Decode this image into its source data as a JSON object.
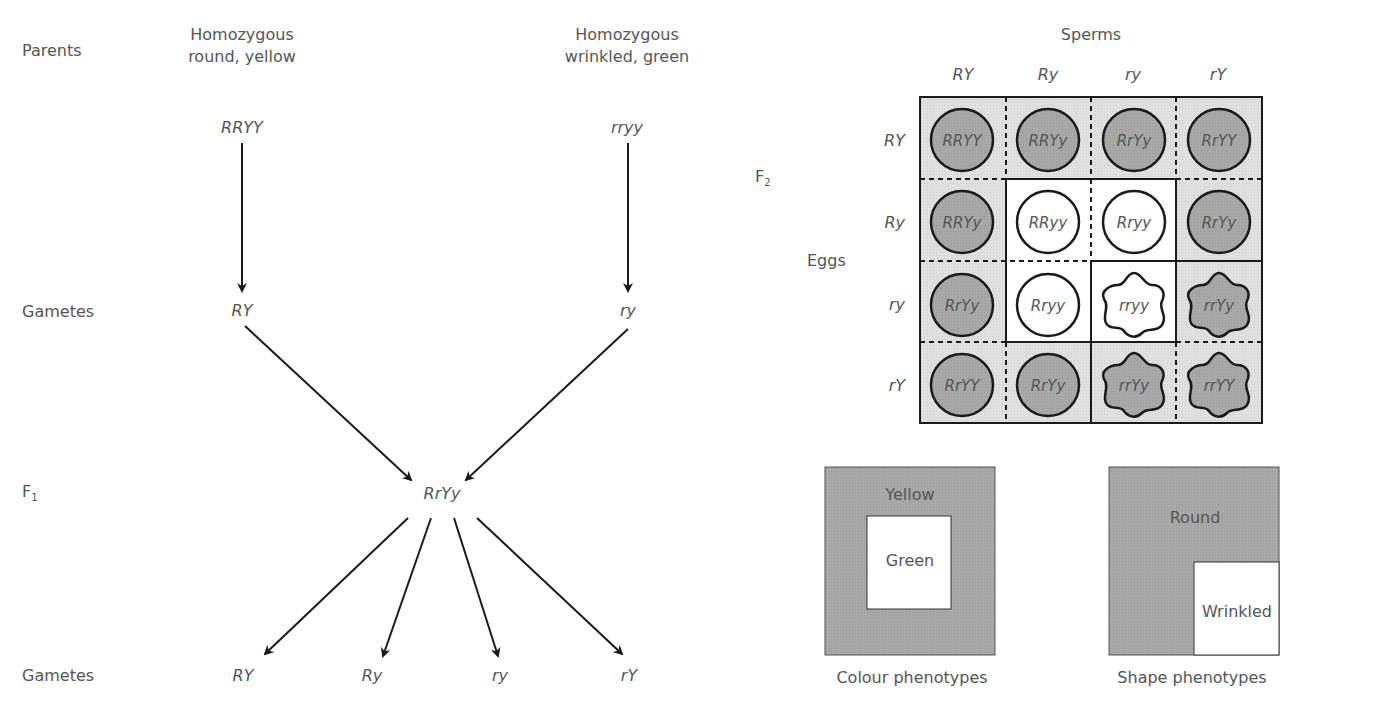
{
  "cross": {
    "row_labels": {
      "parents": "Parents",
      "gametes1": "Gametes",
      "f1": "F",
      "f1_sub": "1",
      "gametes2": "Gametes"
    },
    "parent_left": {
      "description_line1": "Homozygous",
      "description_line2": "round, yellow",
      "genotype": "RRYY",
      "gamete": "RY"
    },
    "parent_right": {
      "description_line1": "Homozygous",
      "description_line2": "wrinkled, green",
      "genotype": "rryy",
      "gamete": "ry"
    },
    "f1_genotype": "RrYy",
    "f1_gametes": [
      "RY",
      "Ry",
      "ry",
      "rY"
    ]
  },
  "punnett": {
    "f2_label": "F",
    "f2_sub": "2",
    "sperms_label": "Sperms",
    "eggs_label": "Eggs",
    "sperm_gametes": [
      "RY",
      "Ry",
      "ry",
      "rY"
    ],
    "egg_gametes": [
      "RY",
      "Ry",
      "ry",
      "rY"
    ],
    "cells": [
      [
        "RRYY",
        "RRYy",
        "RrYy",
        "RrYY"
      ],
      [
        "RRYy",
        "RRyy",
        "Rryy",
        "RrYy"
      ],
      [
        "RrYy",
        "Rryy",
        "rryy",
        "rrYy"
      ],
      [
        "RrYY",
        "RrYy",
        "rrYy",
        "rrYY"
      ]
    ]
  },
  "legends": {
    "colour": {
      "outer": "Yellow",
      "inner": "Green",
      "caption": "Colour phenotypes"
    },
    "shape": {
      "outer": "Round",
      "inner": "Wrinkled",
      "caption": "Shape phenotypes"
    }
  },
  "colors": {
    "yellow_fill": "#a9a9a9",
    "cell_bg": "#dedede",
    "text": "#555555",
    "line": "#1a1a1a"
  }
}
